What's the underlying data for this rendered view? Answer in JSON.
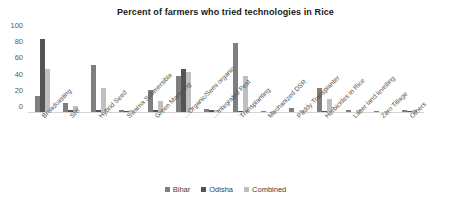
{
  "chart_data": {
    "type": "bar",
    "title": "Percent of farmers who tried technologies in Rice",
    "xlabel": "",
    "ylabel": "",
    "ylim": [
      0,
      100
    ],
    "yticks": [
      0,
      20,
      40,
      60,
      80,
      100
    ],
    "grid": false,
    "legend_position": "bottom",
    "categories": [
      "Broadcasting",
      "SRI",
      "Hybrid Seed",
      "Swarna Submersible",
      "Green Manuring",
      "Organic/Semi organic…",
      "Integrated Pest…",
      "Transplanting",
      "Mechanized DSR",
      "Paddy Transplanter",
      "Herbicides in Rice",
      "Laser land levelling",
      "Zero Tillage",
      "Others"
    ],
    "series": [
      {
        "name": "Bihar",
        "color": "#7f7f7f",
        "values": [
          20,
          11,
          58,
          3,
          27,
          45,
          4,
          85,
          1,
          5,
          30,
          3,
          1,
          2
        ]
      },
      {
        "name": "Odisha",
        "color": "#545454",
        "values": [
          90,
          3,
          3,
          1,
          2,
          53,
          2,
          1,
          0,
          0,
          1,
          0,
          0,
          1
        ]
      },
      {
        "name": "Combined",
        "color": "#bfbfbf",
        "values": [
          53,
          7,
          30,
          2,
          14,
          49,
          3,
          44,
          1,
          3,
          16,
          2,
          1,
          2
        ]
      }
    ]
  },
  "legend": {
    "items": [
      {
        "label": "Bihar",
        "color": "#7f7f7f"
      },
      {
        "label": "Odisha",
        "color": "#545454"
      },
      {
        "label": "Combined",
        "color": "#bfbfbf"
      }
    ]
  }
}
